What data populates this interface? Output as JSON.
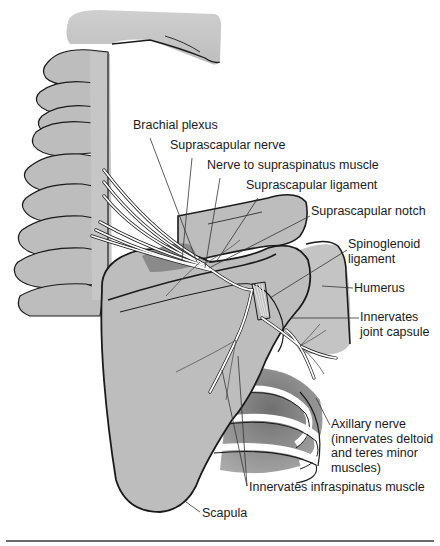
{
  "figure": {
    "colors": {
      "bone_fill": "#bdbdbd",
      "bone_shadow": "#8e8e8e",
      "outline": "#1a1a1a",
      "nerve": "#ffffff",
      "leader_line": "#333333",
      "text": "#1a1a1a",
      "rule": "#6a6a6a"
    }
  },
  "labels": [
    {
      "id": "brachial-plexus",
      "text": "Brachial plexus",
      "x": 133,
      "y": 125
    },
    {
      "id": "suprascapular-nerve",
      "text": "Suprascapular nerve",
      "x": 170,
      "y": 145
    },
    {
      "id": "nerve-to-supraspinatus",
      "text": "Nerve to supraspinatus muscle",
      "x": 207,
      "y": 165
    },
    {
      "id": "suprascapular-ligament",
      "text": "Suprascapular ligament",
      "x": 246,
      "y": 185
    },
    {
      "id": "suprascapular-notch",
      "text": "Suprascapular notch",
      "x": 311,
      "y": 211
    },
    {
      "id": "spinoglenoid-ligament",
      "text": "Spinoglenoid\nligament",
      "x": 348,
      "y": 244
    },
    {
      "id": "humerus",
      "text": "Humerus",
      "x": 354,
      "y": 282
    },
    {
      "id": "innervates-joint-capsule",
      "text": "Innervates\njoint capsule",
      "x": 360,
      "y": 311
    },
    {
      "id": "axillary-nerve",
      "text": "Axillary nerve\n(innervates deltoid\nand teres minor\nmuscles)",
      "x": 331,
      "y": 417
    },
    {
      "id": "innervates-infraspinatus",
      "text": "Innervates infraspinatus muscle",
      "x": 249,
      "y": 482
    },
    {
      "id": "scapula",
      "text": "Scapula",
      "x": 202,
      "y": 507
    }
  ]
}
